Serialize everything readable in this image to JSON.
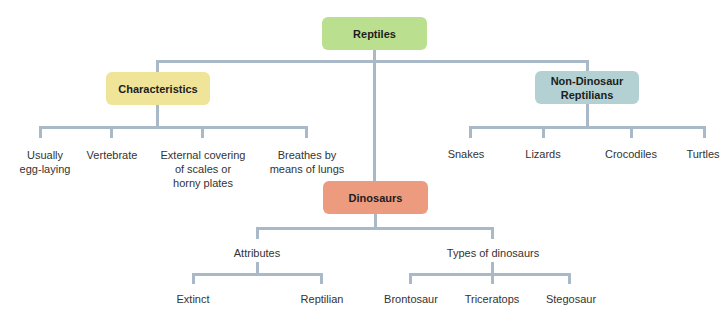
{
  "diagram": {
    "type": "concept-map",
    "colors": {
      "line": "#a9b9c7",
      "reptiles": "#b9df8f",
      "characteristics": "#efe497",
      "non_dinosaur": "#b3d1d3",
      "dinosaurs": "#ec9b7f"
    },
    "root": {
      "label": "Reptiles"
    },
    "characteristics": {
      "label": "Characteristics",
      "children": [
        {
          "line1": "Usually",
          "line2": "egg-laying",
          "line3": ""
        },
        {
          "line1": "Vertebrate",
          "line2": "",
          "line3": ""
        },
        {
          "line1": "External covering",
          "line2": "of scales or",
          "line3": "horny plates"
        },
        {
          "line1": "Breathes by",
          "line2": "means of lungs",
          "line3": ""
        }
      ]
    },
    "non_dinosaur": {
      "line1": "Non-Dinosaur",
      "line2": "Reptilians",
      "children": [
        "Snakes",
        "Lizards",
        "Crocodiles",
        "Turtles"
      ]
    },
    "dinosaurs": {
      "label": "Dinosaurs",
      "attributes": {
        "label": "Attributes",
        "children": [
          "Extinct",
          "Reptilian"
        ]
      },
      "types": {
        "label": "Types of dinosaurs",
        "children": [
          "Brontosaur",
          "Triceratops",
          "Stegosaur"
        ]
      }
    }
  }
}
